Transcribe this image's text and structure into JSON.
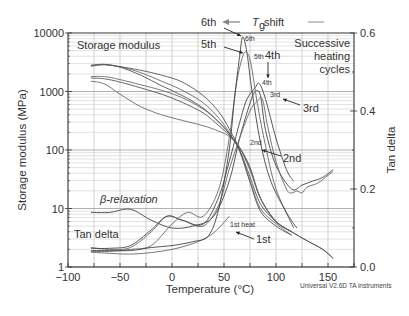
{
  "chart_data": {
    "type": "line",
    "title": "",
    "xlabel": "Temperature (°C)",
    "ylabel": "Storage modulus (MPa)",
    "y2label": "Tan delta",
    "xlim": [
      -100,
      175
    ],
    "ylim": [
      1,
      10000
    ],
    "yscale": "log",
    "y2lim": [
      0.0,
      0.6
    ],
    "grid": true,
    "x_ticks": [
      -100,
      -50,
      0,
      50,
      100,
      150
    ],
    "x_tick_labels": [
      "−100",
      "−50",
      "0",
      "50",
      "100",
      "150"
    ],
    "y_ticks": [
      1,
      10,
      100,
      1000,
      10000
    ],
    "y_tick_labels": [
      "1",
      "10",
      "100",
      "1000",
      "10000"
    ],
    "y2_ticks": [
      0.0,
      0.2,
      0.4,
      0.6
    ],
    "y2_tick_labels": [
      "0.0",
      "0.2",
      "0.4",
      "0.6"
    ],
    "series_storage_modulus": [
      {
        "name": "1st",
        "x": [
          -78,
          -65,
          -50,
          -30,
          -10,
          10,
          30,
          45,
          55,
          65,
          75,
          85,
          100,
          115,
          130,
          145,
          155
        ],
        "y": [
          1500,
          1350,
          900,
          550,
          400,
          320,
          260,
          210,
          170,
          110,
          50,
          15,
          6,
          4,
          2.8,
          2,
          1.4
        ]
      },
      {
        "name": "2nd",
        "x": [
          -78,
          -65,
          -50,
          -30,
          -10,
          10,
          30,
          45,
          55,
          65,
          75,
          85,
          100,
          115,
          130,
          145,
          155
        ],
        "y": [
          1700,
          1650,
          1450,
          1150,
          900,
          650,
          430,
          260,
          180,
          110,
          50,
          15,
          6,
          4,
          2.8,
          2,
          1.4
        ]
      },
      {
        "name": "3rd",
        "x": [
          -78,
          -65,
          -50,
          -30,
          -10,
          10,
          30,
          45,
          55,
          65,
          75,
          85,
          100,
          115
        ],
        "y": [
          1800,
          1800,
          1600,
          1300,
          1050,
          780,
          500,
          300,
          190,
          110,
          45,
          15,
          6,
          4
        ]
      },
      {
        "name": "4th",
        "x": [
          -78,
          -65,
          -50,
          -30,
          -10,
          10,
          30,
          45,
          55,
          65,
          75,
          85,
          100,
          115
        ],
        "y": [
          2800,
          2900,
          2600,
          1900,
          1250,
          850,
          520,
          300,
          190,
          100,
          35,
          12,
          6,
          4
        ]
      },
      {
        "name": "5th",
        "x": [
          -78,
          -65,
          -50,
          -30,
          -10,
          10,
          30,
          45,
          55,
          65,
          75,
          85,
          100,
          115
        ],
        "y": [
          2800,
          2900,
          2650,
          2100,
          1500,
          1050,
          640,
          350,
          200,
          95,
          30,
          10,
          5.5,
          3.5
        ]
      },
      {
        "name": "6th",
        "x": [
          -78,
          -65,
          -50,
          -30,
          -10,
          10,
          30,
          45,
          55,
          65,
          75,
          85,
          100,
          115
        ],
        "y": [
          2700,
          2850,
          2650,
          2300,
          1900,
          1450,
          850,
          450,
          230,
          100,
          28,
          9,
          5,
          3.5
        ]
      }
    ],
    "series_tan_delta": [
      {
        "name": "1st heat",
        "x": [
          -78,
          -60,
          -40,
          -20,
          0,
          20,
          35,
          45,
          55
        ],
        "y": [
          0.038,
          0.035,
          0.033,
          0.037,
          0.045,
          0.06,
          0.078,
          0.1,
          0.13
        ]
      },
      {
        "name": "2nd",
        "x": [
          -78,
          -60,
          -40,
          -20,
          0,
          20,
          40,
          55,
          65,
          75,
          80,
          85,
          90,
          100,
          115,
          125,
          135,
          145,
          155
        ],
        "y": [
          0.14,
          0.14,
          0.148,
          0.12,
          0.1,
          0.105,
          0.13,
          0.22,
          0.33,
          0.42,
          0.45,
          0.44,
          0.35,
          0.26,
          0.2,
          0.21,
          0.22,
          0.23,
          0.25
        ]
      },
      {
        "name": "3rd",
        "x": [
          -78,
          -60,
          -40,
          -20,
          -5,
          10,
          30,
          45,
          55,
          65,
          75,
          82,
          87,
          92,
          100,
          110,
          115,
          120,
          125,
          130,
          140,
          150,
          155
        ],
        "y": [
          0.05,
          0.045,
          0.05,
          0.09,
          0.13,
          0.12,
          0.105,
          0.16,
          0.25,
          0.33,
          0.4,
          0.425,
          0.43,
          0.36,
          0.27,
          0.2,
          0.19,
          0.195,
          0.19,
          0.205,
          0.215,
          0.235,
          0.245
        ]
      },
      {
        "name": "4th",
        "x": [
          -78,
          -60,
          -40,
          -20,
          -5,
          10,
          30,
          45,
          55,
          65,
          72,
          80,
          84,
          90,
          100,
          110,
          117
        ],
        "y": [
          0.048,
          0.048,
          0.055,
          0.095,
          0.13,
          0.12,
          0.11,
          0.18,
          0.27,
          0.37,
          0.43,
          0.46,
          0.47,
          0.43,
          0.33,
          0.25,
          0.22
        ]
      },
      {
        "name": "5th",
        "x": [
          -78,
          -60,
          -40,
          -20,
          0,
          15,
          30,
          45,
          55,
          62,
          68,
          72,
          76,
          82,
          90,
          100,
          117
        ],
        "y": [
          0.04,
          0.04,
          0.045,
          0.055,
          0.11,
          0.14,
          0.13,
          0.2,
          0.33,
          0.47,
          0.54,
          0.55,
          0.52,
          0.42,
          0.31,
          0.2,
          0.1
        ]
      },
      {
        "name": "6th",
        "x": [
          -78,
          -60,
          -40,
          -20,
          0,
          20,
          35,
          45,
          55,
          60,
          65,
          68,
          72,
          77,
          85,
          95,
          110,
          120
        ],
        "y": [
          0.042,
          0.042,
          0.042,
          0.05,
          0.055,
          0.065,
          0.08,
          0.15,
          0.3,
          0.43,
          0.54,
          0.59,
          0.55,
          0.45,
          0.32,
          0.22,
          0.14,
          0.1
        ]
      }
    ],
    "annotations": {
      "storage_modulus": "Storage modulus",
      "successive_line1": "Successive",
      "successive_line2": "heating",
      "successive_line3": "cycles",
      "beta_relaxation": "β-relaxation",
      "tan_delta": "Tan delta",
      "tg_shift_T": "T",
      "tg_shift_sub": "g",
      "tg_shift_rest": " shift",
      "peak_labels_big": [
        "6th",
        "5th",
        "4th",
        "3rd",
        "2nd",
        "1st"
      ],
      "peak_labels_small": [
        "6th",
        "5th",
        "4th",
        "3rd",
        "2nd",
        "1st heat"
      ]
    },
    "footer": "Universal V2.6D TA instruments"
  }
}
